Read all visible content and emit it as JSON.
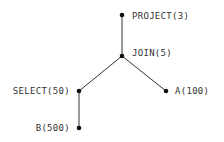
{
  "diagram": {
    "type": "query-plan-tree",
    "nodes": [
      {
        "id": "project",
        "label": "PROJECT(3)",
        "operator": "PROJECT",
        "cardinality": 3
      },
      {
        "id": "join",
        "label": "JOIN(5)",
        "operator": "JOIN",
        "cardinality": 5
      },
      {
        "id": "select",
        "label": "SELECT(50)",
        "operator": "SELECT",
        "cardinality": 50
      },
      {
        "id": "a",
        "label": "A(100)",
        "operator": "A",
        "cardinality": 100
      },
      {
        "id": "b",
        "label": "B(500)",
        "operator": "B",
        "cardinality": 500
      }
    ],
    "edges": [
      {
        "from": "project",
        "to": "join"
      },
      {
        "from": "join",
        "to": "select"
      },
      {
        "from": "join",
        "to": "a"
      },
      {
        "from": "select",
        "to": "b"
      }
    ]
  }
}
